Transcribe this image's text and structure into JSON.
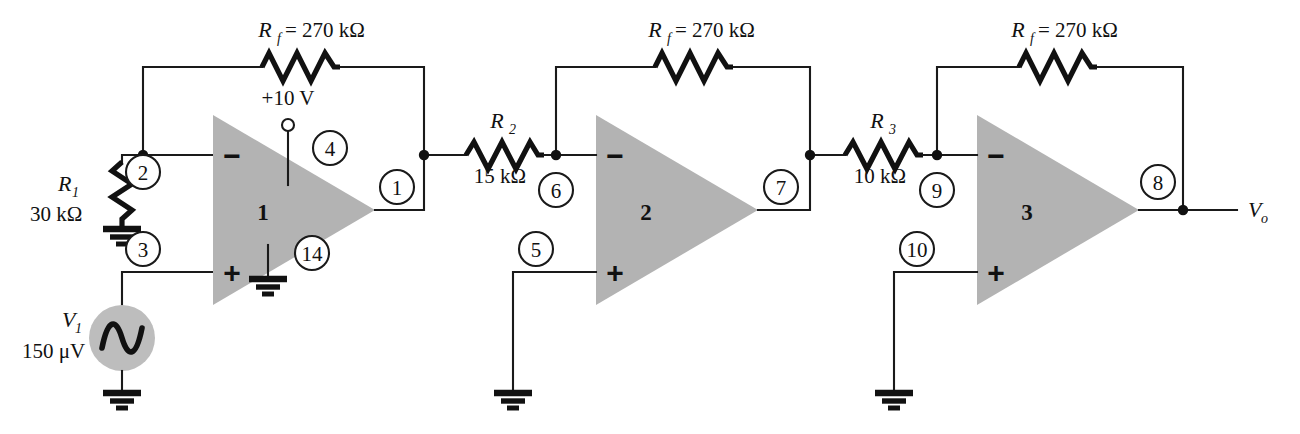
{
  "diagram": {
    "colors": {
      "wire": "#1a1a1a",
      "opamp_fill": "#b3b3b3",
      "source_fill": "#bdbdbd",
      "background": "#ffffff"
    }
  },
  "components": {
    "rf1": {
      "name": "R",
      "sub": "f",
      "eq": "= 270 kΩ",
      "full_label": "Rf = 270 kΩ"
    },
    "rf2": {
      "name": "R",
      "sub": "f",
      "eq": "= 270 kΩ",
      "full_label": "Rf = 270 kΩ"
    },
    "rf3": {
      "name": "R",
      "sub": "f",
      "eq": "= 270 kΩ",
      "full_label": "Rf = 270 kΩ"
    },
    "r1": {
      "name": "R",
      "sub": "1",
      "value": "30 kΩ",
      "full_label": "R1 = 30 kΩ"
    },
    "r2": {
      "name": "R",
      "sub": "2",
      "value": "15 kΩ",
      "full_label": "R2 = 15 kΩ"
    },
    "r3": {
      "name": "R",
      "sub": "3",
      "value": "10 kΩ",
      "full_label": "R3 = 10 kΩ"
    },
    "source": {
      "name": "V",
      "sub": "1",
      "value": "150 μV",
      "full_label": "V1 = 150 μV"
    },
    "supply": {
      "label": "+10 V"
    },
    "output": {
      "name": "V",
      "sub": "o",
      "full_label": "Vo"
    }
  },
  "opamps": [
    {
      "id": "opamp-1",
      "number": "1",
      "minus": "−",
      "plus": "+"
    },
    {
      "id": "opamp-2",
      "number": "2",
      "minus": "−",
      "plus": "+"
    },
    {
      "id": "opamp-3",
      "number": "3",
      "minus": "−",
      "plus": "+"
    }
  ],
  "nodes": [
    {
      "id": "node-1",
      "label": "1",
      "cx": 430,
      "cy": 187
    },
    {
      "id": "node-2",
      "label": "2",
      "cx": 143,
      "cy": 172
    },
    {
      "id": "node-3",
      "label": "3",
      "cx": 143,
      "cy": 249
    },
    {
      "id": "node-4",
      "label": "4",
      "cx": 308,
      "cy": 148
    },
    {
      "id": "node-5",
      "label": "5",
      "cx": 532,
      "cy": 249
    },
    {
      "id": "node-6",
      "label": "6",
      "cx": 556,
      "cy": 172
    },
    {
      "id": "node-7",
      "label": "7",
      "cx": 797,
      "cy": 187
    },
    {
      "id": "node-8",
      "label": "8",
      "cx": 1158,
      "cy": 182
    },
    {
      "id": "node-9",
      "label": "9",
      "cx": 917,
      "cy": 172
    },
    {
      "id": "node-10",
      "label": "10",
      "cx": 896,
      "cy": 249
    },
    {
      "id": "node-14",
      "label": "14",
      "cx": 308,
      "cy": 253
    }
  ],
  "grounds": [
    {
      "id": "ground-r1",
      "x": 122,
      "y": 228
    },
    {
      "id": "ground-opamp1",
      "x": 268,
      "y": 278
    },
    {
      "id": "ground-source",
      "x": 122,
      "y": 392
    },
    {
      "id": "ground-opamp2",
      "x": 513,
      "y": 392
    },
    {
      "id": "ground-opamp3",
      "x": 894,
      "y": 392
    }
  ]
}
